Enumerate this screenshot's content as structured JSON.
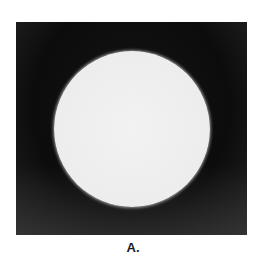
{
  "figure": {
    "panel_label": "A."
  }
}
